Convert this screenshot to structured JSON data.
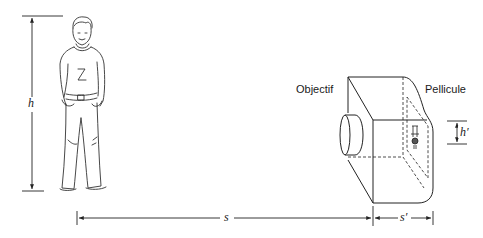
{
  "diagram": {
    "type": "camera-image-formation",
    "labels": {
      "lens": "Objectif",
      "film": "Pellicule",
      "object_height": "h",
      "image_height": "h′",
      "object_distance": "s",
      "image_distance": "s′"
    },
    "colors": {
      "stroke": "#222222",
      "background": "#ffffff"
    }
  }
}
